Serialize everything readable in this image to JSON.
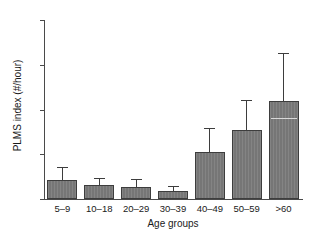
{
  "chart_data": {
    "type": "bar",
    "title": "",
    "xlabel": "Age groups",
    "ylabel": "PLMS index (#/hour)",
    "categories": [
      "5–9",
      "10–18",
      "20–29",
      "30–39",
      "40–49",
      "50–59",
      ">60"
    ],
    "values": [
      4.3,
      3.2,
      2.7,
      1.7,
      10.5,
      15.5,
      22.0
    ],
    "errors_upper": [
      2.7,
      1.2,
      1.5,
      0.9,
      5.1,
      6.5,
      10.5
    ],
    "ylim": [
      0,
      40
    ],
    "yticks": [
      0,
      10,
      20,
      30,
      40
    ],
    "ytick_labels": [
      "0",
      "10",
      "20",
      "30",
      "40"
    ],
    "grid": false,
    "legend": null,
    "bar_color": "#767676",
    "bar_edge_color": "#3d3d3d",
    "error_color": "#3d3d3d",
    "axis_color": "#4a4a4a",
    "background": "#ffffff"
  }
}
